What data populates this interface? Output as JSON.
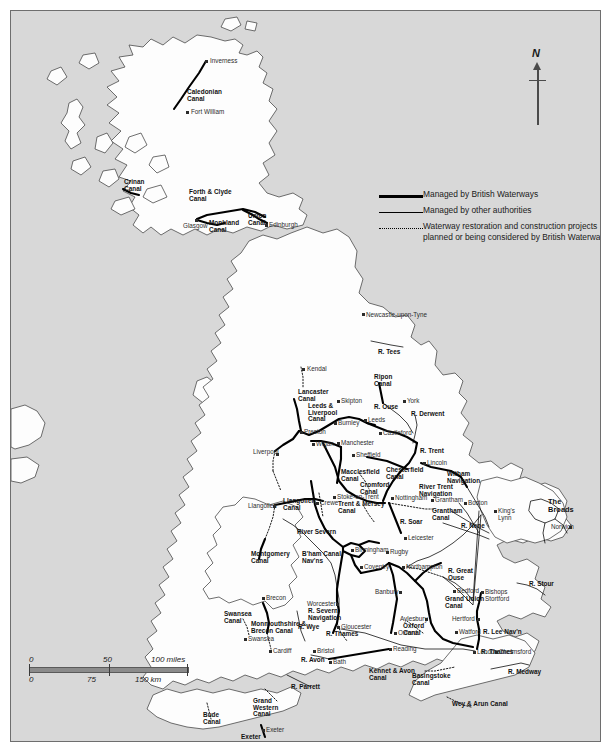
{
  "map": {
    "title": "Inland waterways of Great Britain",
    "colors": {
      "sea": "#d8d8d8",
      "land": "#ffffff",
      "coast_line": "#4a4a4a",
      "managed_bw": "#000000",
      "managed_other": "#000000",
      "restoration": "#000000",
      "frame": "#6e6e6e"
    }
  },
  "legend": {
    "items": [
      {
        "key": "thick-line",
        "label": "Managed by British Waterways"
      },
      {
        "key": "thin-line",
        "label": "Managed by other authorities"
      },
      {
        "key": "dotted-line",
        "label": "Waterway restoration and construction projects planned or being considered by British Waterways"
      }
    ]
  },
  "north_arrow": {
    "label": "N"
  },
  "scale_bar": {
    "miles": {
      "unit": "miles",
      "ticks": [
        "0",
        "50",
        "100 miles"
      ]
    },
    "km": {
      "unit": "km",
      "ticks": [
        "0",
        "75",
        "150 km"
      ]
    }
  },
  "canals": [
    {
      "name": "Caledonian\nCanal",
      "x": 176,
      "y": 78
    },
    {
      "name": "Crinan\nCanal",
      "x": 113,
      "y": 168
    },
    {
      "name": "Forth & Clyde\nCanal",
      "x": 178,
      "y": 178
    },
    {
      "name": "Union\nCanal",
      "x": 237,
      "y": 202
    },
    {
      "name": "Monkland\nCanal",
      "x": 198,
      "y": 209
    },
    {
      "name": "Ripon\nCanal",
      "x": 363,
      "y": 363
    },
    {
      "name": "Lancaster\nCanal",
      "x": 287,
      "y": 378
    },
    {
      "name": "Leeds &\nLiverpool\nCanal",
      "x": 297,
      "y": 392
    },
    {
      "name": "Macclesfield\nCanal",
      "x": 330,
      "y": 458
    },
    {
      "name": "Chesterfield\nCanal",
      "x": 375,
      "y": 456
    },
    {
      "name": "Cromford\nCanal",
      "x": 349,
      "y": 471
    },
    {
      "name": "Witham\nNavigation",
      "x": 436,
      "y": 460
    },
    {
      "name": "River Trent\nNavigation",
      "x": 408,
      "y": 473
    },
    {
      "name": "Trent & Mersey\nCanal",
      "x": 327,
      "y": 490
    },
    {
      "name": "Grantham\nCanal",
      "x": 421,
      "y": 497
    },
    {
      "name": "Llangollen\nCanal",
      "x": 272,
      "y": 487
    },
    {
      "name": "Montgomery\nCanal",
      "x": 240,
      "y": 540
    },
    {
      "name": "B'ham Canal\nNav'ns",
      "x": 291,
      "y": 540
    },
    {
      "name": "R. Severn\nNavigation",
      "x": 297,
      "y": 597
    },
    {
      "name": "Swansea\nCanal",
      "x": 213,
      "y": 600
    },
    {
      "name": "Monmouthshire &\nBrecon Canal",
      "x": 240,
      "y": 610
    },
    {
      "name": "Oxford\nCanal",
      "x": 392,
      "y": 612
    },
    {
      "name": "Grand Union\nCanal",
      "x": 434,
      "y": 585
    },
    {
      "name": "R. Lee Nav'n",
      "x": 472,
      "y": 618
    },
    {
      "name": "Kennet & Avon\nCanal",
      "x": 358,
      "y": 657
    },
    {
      "name": "Basingstoke\nCanal",
      "x": 401,
      "y": 662
    },
    {
      "name": "Wey & Arun Canal",
      "x": 441,
      "y": 690
    },
    {
      "name": "Bude\nCanal",
      "x": 192,
      "y": 701
    },
    {
      "name": "Grand\nWestern\nCanal",
      "x": 242,
      "y": 687
    },
    {
      "name": "Exeter\nShip Canal",
      "x": 230,
      "y": 723
    }
  ],
  "rivers": [
    {
      "name": "R. Tees",
      "x": 367,
      "y": 338
    },
    {
      "name": "R. Ouse",
      "x": 363,
      "y": 393
    },
    {
      "name": "R. Derwent",
      "x": 400,
      "y": 400
    },
    {
      "name": "R. Trent",
      "x": 409,
      "y": 437
    },
    {
      "name": "R. Soar",
      "x": 389,
      "y": 508
    },
    {
      "name": "R. Nene",
      "x": 450,
      "y": 512
    },
    {
      "name": "River Severn",
      "x": 286,
      "y": 518
    },
    {
      "name": "R. Great\nOuse",
      "x": 437,
      "y": 557
    },
    {
      "name": "R. Wye",
      "x": 287,
      "y": 613
    },
    {
      "name": "R. Thames",
      "x": 315,
      "y": 620
    },
    {
      "name": "R. Thames",
      "x": 470,
      "y": 638
    },
    {
      "name": "R. Avon",
      "x": 290,
      "y": 646
    },
    {
      "name": "R. Stour",
      "x": 518,
      "y": 570
    },
    {
      "name": "R. Medway",
      "x": 497,
      "y": 658
    },
    {
      "name": "R. Parrett",
      "x": 280,
      "y": 673
    }
  ],
  "regions": [
    {
      "name": "The\nBroads",
      "x": 537,
      "y": 487
    }
  ],
  "cities": [
    {
      "name": "Inverness",
      "x": 199,
      "y": 47,
      "dot": 194,
      "doty": 49
    },
    {
      "name": "Fort William",
      "x": 180,
      "y": 98,
      "dot": 175,
      "doty": 100
    },
    {
      "name": "Glasgow",
      "x": 172,
      "y": 212,
      "dot": 184,
      "doty": 208
    },
    {
      "name": "Edinburgh",
      "x": 258,
      "y": 211,
      "dot": 254,
      "doty": 213
    },
    {
      "name": "Newcastle-upon-Tyne",
      "x": 355,
      "y": 301,
      "dot": 351,
      "doty": 302
    },
    {
      "name": "Kendal",
      "x": 296,
      "y": 355,
      "dot": 291,
      "doty": 357
    },
    {
      "name": "Skipton",
      "x": 330,
      "y": 387,
      "dot": 326,
      "doty": 389
    },
    {
      "name": "York",
      "x": 396,
      "y": 387,
      "dot": 392,
      "doty": 389
    },
    {
      "name": "Leeds",
      "x": 357,
      "y": 406,
      "dot": 353,
      "doty": 408
    },
    {
      "name": "Burnley",
      "x": 327,
      "y": 409,
      "dot": 323,
      "doty": 411
    },
    {
      "name": "Castleford",
      "x": 372,
      "y": 419,
      "dot": 368,
      "doty": 421
    },
    {
      "name": "Preston",
      "x": 293,
      "y": 418,
      "dot": 289,
      "doty": 420
    },
    {
      "name": "Wigan",
      "x": 305,
      "y": 430,
      "dot": 301,
      "doty": 432
    },
    {
      "name": "Manchester",
      "x": 330,
      "y": 429,
      "dot": 326,
      "doty": 431
    },
    {
      "name": "Liverpool",
      "x": 242,
      "y": 438,
      "dot": 265,
      "doty": 442
    },
    {
      "name": "Sheffield",
      "x": 345,
      "y": 441,
      "dot": 341,
      "doty": 443
    },
    {
      "name": "Lincoln",
      "x": 416,
      "y": 449,
      "dot": 412,
      "doty": 451
    },
    {
      "name": "Boston",
      "x": 457,
      "y": 489,
      "dot": 453,
      "doty": 491
    },
    {
      "name": "King's\nLynn",
      "x": 487,
      "y": 497,
      "dot": 483,
      "doty": 499
    },
    {
      "name": "Norwich",
      "x": 540,
      "y": 513,
      "dot": 558,
      "doty": 515
    },
    {
      "name": "Crewe",
      "x": 309,
      "y": 489,
      "dot": 305,
      "doty": 491
    },
    {
      "name": "Stoke-on-Trent",
      "x": 326,
      "y": 483,
      "dot": 322,
      "doty": 485
    },
    {
      "name": "Nottingham",
      "x": 384,
      "y": 484,
      "dot": 380,
      "doty": 486
    },
    {
      "name": "Grantham",
      "x": 424,
      "y": 486,
      "dot": 420,
      "doty": 488
    },
    {
      "name": "Llangollen",
      "x": 237,
      "y": 492,
      "dot": 262,
      "doty": 494
    },
    {
      "name": "Leicester",
      "x": 397,
      "y": 524,
      "dot": 393,
      "doty": 526
    },
    {
      "name": "Birmingham",
      "x": 344,
      "y": 536,
      "dot": 340,
      "doty": 538
    },
    {
      "name": "Rugby",
      "x": 379,
      "y": 538,
      "dot": 375,
      "doty": 540
    },
    {
      "name": "Coventry",
      "x": 353,
      "y": 553,
      "dot": 349,
      "doty": 555
    },
    {
      "name": "Northampton",
      "x": 395,
      "y": 553,
      "dot": 391,
      "doty": 555
    },
    {
      "name": "Bedford",
      "x": 446,
      "y": 577,
      "dot": 442,
      "doty": 579
    },
    {
      "name": "Bishops\nStortford",
      "x": 474,
      "y": 578,
      "dot": 470,
      "doty": 580
    },
    {
      "name": "Worcester",
      "x": 296,
      "y": 590,
      "dot": 325,
      "doty": 592
    },
    {
      "name": "Banbury",
      "x": 364,
      "y": 578,
      "dot": 388,
      "doty": 580
    },
    {
      "name": "Brecon",
      "x": 255,
      "y": 584,
      "dot": 251,
      "doty": 586
    },
    {
      "name": "Hertford",
      "x": 441,
      "y": 605,
      "dot": 466,
      "doty": 607
    },
    {
      "name": "Aylesbury",
      "x": 389,
      "y": 605,
      "dot": 414,
      "doty": 607
    },
    {
      "name": "Gloucester",
      "x": 330,
      "y": 613,
      "dot": 326,
      "doty": 615
    },
    {
      "name": "Oxford",
      "x": 387,
      "y": 619,
      "dot": 383,
      "doty": 621
    },
    {
      "name": "Watford",
      "x": 448,
      "y": 618,
      "dot": 444,
      "doty": 620
    },
    {
      "name": "Reading",
      "x": 382,
      "y": 635,
      "dot": 378,
      "doty": 637
    },
    {
      "name": "Swansea",
      "x": 237,
      "y": 625,
      "dot": 233,
      "doty": 627
    },
    {
      "name": "Cardiff",
      "x": 262,
      "y": 637,
      "dot": 258,
      "doty": 639
    },
    {
      "name": "Bristol",
      "x": 306,
      "y": 637,
      "dot": 302,
      "doty": 639
    },
    {
      "name": "Bath",
      "x": 322,
      "y": 648,
      "dot": 318,
      "doty": 650
    },
    {
      "name": "London",
      "x": 466,
      "y": 638,
      "dot": 462,
      "doty": 640
    },
    {
      "name": "Chelmsford",
      "x": 488,
      "y": 638,
      "dot": 484,
      "doty": 640
    },
    {
      "name": "Exeter",
      "x": 255,
      "y": 716,
      "dot": 251,
      "doty": 718
    }
  ]
}
